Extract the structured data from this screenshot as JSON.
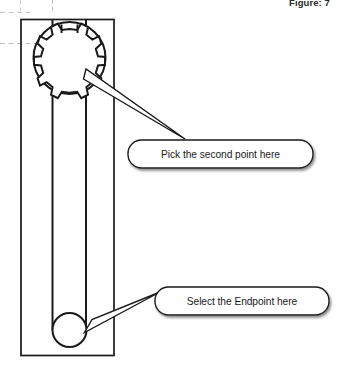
{
  "figure": {
    "caption": "Figure: 7"
  },
  "drawing": {
    "title": "box-wrench-technical-drawing",
    "outline_color": "#1a1a1a",
    "centerline_color": "#bfbfbf",
    "background_color": "#ffffff",
    "parts": [
      {
        "name": "bounding-rectangle",
        "label": "Drawing boundary rectangle"
      },
      {
        "name": "wrench-head-outer-circle",
        "label": "Outer circle of wrench head"
      },
      {
        "name": "wrench-socket-star",
        "label": "12-point socket profile"
      },
      {
        "name": "wrench-handle",
        "label": "Wrench handle shaft"
      },
      {
        "name": "handle-end-circle",
        "label": "Circle at handle end"
      },
      {
        "name": "horizontal-centerline",
        "label": "Horizontal centerline"
      },
      {
        "name": "vertical-centerline",
        "label": "Vertical centerline"
      }
    ]
  },
  "callouts": [
    {
      "id": "pick-second-point",
      "text": "Pick the second point here",
      "target": "wrench-socket-star"
    },
    {
      "id": "select-endpoint",
      "text": "Select the Endpoint here",
      "target": "handle-end-circle"
    }
  ]
}
